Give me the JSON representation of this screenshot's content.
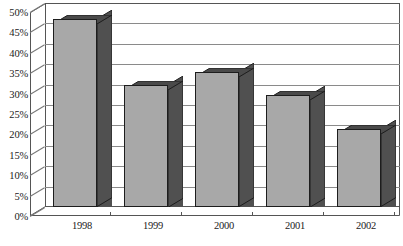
{
  "chart_data": {
    "type": "bar",
    "title": "",
    "subtitle": "",
    "xlabel": "",
    "ylabel": "",
    "categories": [
      "1998",
      "1999",
      "2000",
      "2001",
      "2002"
    ],
    "values": [
      46,
      30,
      33,
      27.5,
      19
    ],
    "series": [
      {
        "name": "",
        "values": [
          46,
          30,
          33,
          27.5,
          19
        ]
      }
    ],
    "ylim": [
      0,
      50
    ],
    "ytick_step": 5,
    "ytick_labels": [
      "50%",
      "45%",
      "40%",
      "35%",
      "30%",
      "25%",
      "20%",
      "15%",
      "10%",
      "5%",
      "0%"
    ],
    "ytick_values": [
      50,
      45,
      40,
      35,
      30,
      25,
      20,
      15,
      10,
      5,
      0
    ],
    "grid": true,
    "legend": false,
    "legend_position": "none",
    "style_3d": true,
    "annotations": []
  },
  "colors": {
    "bar_front": "#a8a8a8",
    "bar_side": "#505050",
    "bar_top": "#4a4a4a",
    "bar_outline": "#1d1d1d",
    "gridline": "#8a8a8a",
    "axis": "#555555",
    "plot_background": "#ffffff",
    "text": "#1a1a1a"
  },
  "footnote": {
    "text": ""
  }
}
